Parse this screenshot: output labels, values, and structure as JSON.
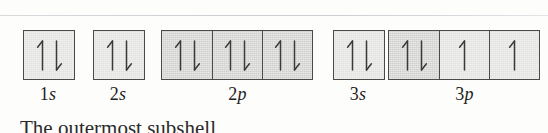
{
  "figure": {
    "kind": "orbital-box-diagram",
    "background_color": "#fdfdfc",
    "rule_color": "#d0d0d5",
    "border_color": "#4a4a4a",
    "fill_light": "#e9e9e7",
    "fill_medium": "#d8d8d6",
    "arrow_color": "#3a3a3a"
  },
  "orbitals": [
    {
      "id": "1s",
      "label_number": "1",
      "label_letter": "s",
      "left": 23,
      "label_left": 23,
      "label_width": 50,
      "boxes": [
        {
          "shade": "light",
          "spins": [
            "up",
            "down"
          ]
        }
      ]
    },
    {
      "id": "2s",
      "label_number": "2",
      "label_letter": "s",
      "left": 93,
      "label_left": 93,
      "label_width": 50,
      "boxes": [
        {
          "shade": "light",
          "spins": [
            "up",
            "down"
          ]
        }
      ]
    },
    {
      "id": "2p",
      "label_number": "2",
      "label_letter": "p",
      "left": 161,
      "label_left": 161,
      "label_width": 153,
      "boxes": [
        {
          "shade": "medium",
          "spins": [
            "up",
            "down"
          ]
        },
        {
          "shade": "medium",
          "spins": [
            "up",
            "down"
          ]
        },
        {
          "shade": "medium",
          "spins": [
            "up",
            "down"
          ]
        }
      ]
    },
    {
      "id": "3s",
      "label_number": "3",
      "label_letter": "s",
      "left": 333,
      "label_left": 333,
      "label_width": 50,
      "boxes": [
        {
          "shade": "light",
          "spins": [
            "up",
            "down"
          ]
        }
      ]
    },
    {
      "id": "3p",
      "label_number": "3",
      "label_letter": "p",
      "left": 388,
      "label_left": 388,
      "label_width": 153,
      "boxes": [
        {
          "shade": "medium",
          "spins": [
            "up",
            "down"
          ]
        },
        {
          "shade": "light",
          "spins": [
            "up"
          ]
        },
        {
          "shade": "light",
          "spins": [
            "up"
          ]
        }
      ]
    }
  ],
  "clipped_text": "The outermost subshell"
}
